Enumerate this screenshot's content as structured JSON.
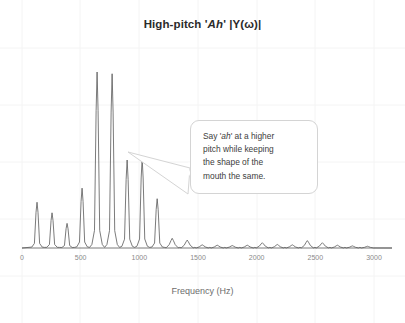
{
  "slide": {
    "background_color": "#ffffff"
  },
  "chart_title": {
    "prefix": "High-pitch '",
    "emphasis": "Ah",
    "suffix": "' |Y(ω)|",
    "full": "High-pitch 'Ah' |Y(ω)|"
  },
  "callout": {
    "line1_pre": "Say '",
    "line1_em": "ah",
    "line1_post": "' at a higher",
    "line2": "pitch while keeping",
    "line3": "the shape of the",
    "line4": "mouth the same.",
    "full_text": "Say 'ah' at a higher pitch while keeping the shape of the mouth the same.",
    "border_color": "#d4d4d4",
    "fill_color": "#ffffff"
  },
  "axis": {
    "x_label": "Frequency (Hz)",
    "x_ticks": [
      "0",
      "500",
      "1000",
      "1500",
      "2000",
      "2500",
      "3000"
    ],
    "tick_color": "#8a8a8a",
    "label_color": "#6d6d6d"
  },
  "chart_data": {
    "type": "line",
    "title": "High-pitch 'Ah' |Y(ω)|",
    "xlabel": "Frequency (Hz)",
    "ylabel": "",
    "xlim": [
      0,
      3000
    ],
    "ylim": [
      0,
      1.0
    ],
    "grid": false,
    "legend": null,
    "trace_color": "#595959",
    "fundamental_hz": 128,
    "peaks": [
      {
        "hz": 128,
        "amplitude": 0.26
      },
      {
        "hz": 256,
        "amplitude": 0.2
      },
      {
        "hz": 384,
        "amplitude": 0.14
      },
      {
        "hz": 512,
        "amplitude": 0.34
      },
      {
        "hz": 640,
        "amplitude": 1.0
      },
      {
        "hz": 768,
        "amplitude": 0.99
      },
      {
        "hz": 896,
        "amplitude": 0.5
      },
      {
        "hz": 1024,
        "amplitude": 0.51
      },
      {
        "hz": 1152,
        "amplitude": 0.28
      },
      {
        "hz": 1280,
        "amplitude": 0.055
      },
      {
        "hz": 1408,
        "amplitude": 0.045
      },
      {
        "hz": 1536,
        "amplitude": 0.018
      },
      {
        "hz": 1664,
        "amplitude": 0.016
      },
      {
        "hz": 1792,
        "amplitude": 0.014
      },
      {
        "hz": 1920,
        "amplitude": 0.016
      },
      {
        "hz": 2048,
        "amplitude": 0.03
      },
      {
        "hz": 2176,
        "amplitude": 0.02
      },
      {
        "hz": 2304,
        "amplitude": 0.018
      },
      {
        "hz": 2432,
        "amplitude": 0.042
      },
      {
        "hz": 2560,
        "amplitude": 0.03
      },
      {
        "hz": 2688,
        "amplitude": 0.016
      },
      {
        "hz": 2816,
        "amplitude": 0.012
      },
      {
        "hz": 2944,
        "amplitude": 0.01
      }
    ]
  }
}
